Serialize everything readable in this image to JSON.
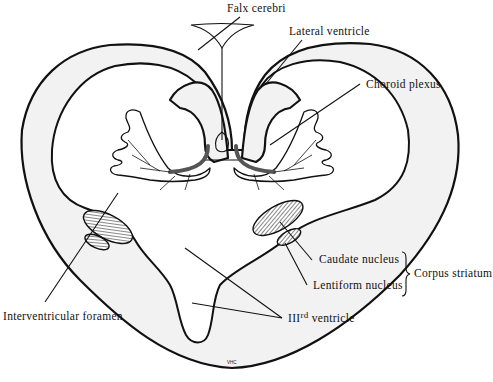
{
  "diagram": {
    "labels": {
      "falx_cerebri": "Falx cerebri",
      "lateral_ventricle": "Lateral ventricle",
      "choroid_plexus": "Choroid plexus",
      "caudate_nucleus": "Caudate nucleus",
      "lentiform_nucleus": "Lentiform nucleus",
      "corpus_striatum": "Corpus striatum",
      "interventricular_foramen": "Interventricular foramen",
      "third_ventricle_prefix": "III",
      "third_ventricle_superscript": "rd",
      "third_ventricle_suffix": " ventricle"
    },
    "signature": "VHC",
    "colors": {
      "outline": "#111111",
      "wall_fill": "#f2f2f2",
      "background": "#ffffff"
    }
  }
}
